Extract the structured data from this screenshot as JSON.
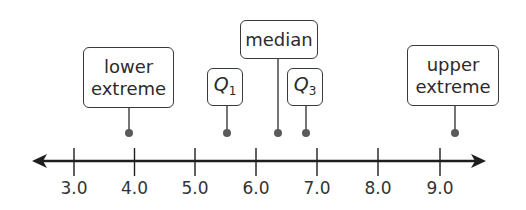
{
  "diagram": {
    "type": "number-line-five-number-summary",
    "axis": {
      "min": 3.0,
      "max": 9.0,
      "step": 1.0,
      "tick_labels": [
        "3.0",
        "4.0",
        "5.0",
        "6.0",
        "7.0",
        "8.0",
        "9.0"
      ],
      "arrows": "both",
      "color": "#1e1e1e"
    },
    "callouts": [
      {
        "id": "lower-extreme",
        "lines": [
          "lower",
          "extreme"
        ],
        "value": 3.9
      },
      {
        "id": "q1",
        "symbol": "Q",
        "subscript": "1",
        "value": 5.5
      },
      {
        "id": "median",
        "lines": [
          "median"
        ],
        "value": 6.35
      },
      {
        "id": "q3",
        "symbol": "Q",
        "subscript": "3",
        "value": 6.8
      },
      {
        "id": "upper-extreme",
        "lines": [
          "upper",
          "extreme"
        ],
        "value": 9.2
      }
    ],
    "point_color": "#5a5a5a"
  },
  "labels": {
    "lower_1": "lower",
    "lower_2": "extreme",
    "median": "median",
    "q1_sym": "Q",
    "q1_sub": "1",
    "q3_sym": "Q",
    "q3_sub": "3",
    "upper_1": "upper",
    "upper_2": "extreme",
    "t0": "3.0",
    "t1": "4.0",
    "t2": "5.0",
    "t3": "6.0",
    "t4": "7.0",
    "t5": "8.0",
    "t6": "9.0"
  }
}
